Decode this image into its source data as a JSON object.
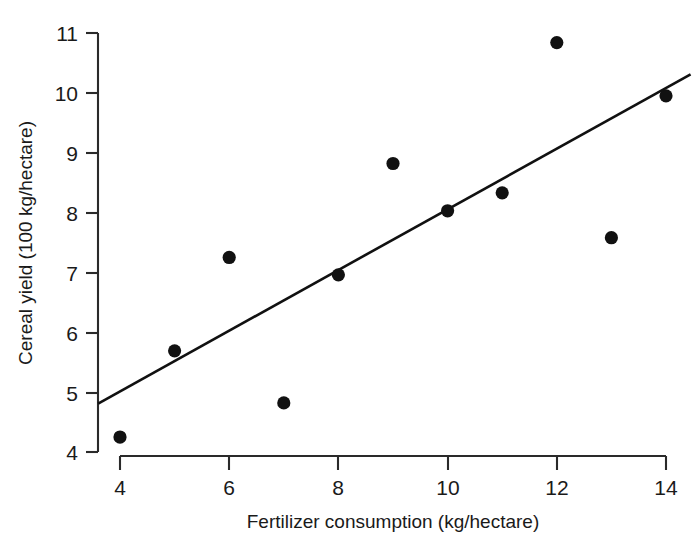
{
  "figure": {
    "background_color": "#ffffff",
    "foreground_color": "#1a1a1a",
    "width": 699,
    "height": 543
  },
  "chart_data": {
    "type": "scatter",
    "title": "",
    "subtitle": "",
    "xlabel": "Fertilizer consumption (kg/hectare)",
    "ylabel": "Cereal yield (100 kg/hectare)",
    "xlim": [
      3.6,
      14.6
    ],
    "ylim": [
      3.86,
      11.0
    ],
    "xticks": [
      4,
      6,
      8,
      10,
      12,
      14
    ],
    "xtick_labels": [
      "4",
      "6",
      "8",
      "10",
      "12",
      "14"
    ],
    "yticks": [
      4,
      5,
      6,
      7,
      8,
      9,
      10,
      11
    ],
    "ytick_labels": [
      "4",
      "5",
      "6",
      "7",
      "8",
      "9",
      "10",
      "11"
    ],
    "grid": false,
    "legend": false,
    "legend_position": "none",
    "marker": "filled-circle",
    "marker_color": "#111111",
    "marker_size": 7,
    "x": [
      4,
      5,
      6,
      7,
      8,
      9,
      10,
      11,
      12,
      13,
      14
    ],
    "y": [
      4.25,
      5.69,
      7.25,
      4.82,
      6.96,
      8.82,
      8.03,
      8.33,
      10.84,
      7.58,
      9.95
    ],
    "points": [
      {
        "x": 4,
        "y": 4.25
      },
      {
        "x": 5,
        "y": 5.69
      },
      {
        "x": 6,
        "y": 7.25
      },
      {
        "x": 7,
        "y": 4.82
      },
      {
        "x": 8,
        "y": 6.96
      },
      {
        "x": 9,
        "y": 8.82
      },
      {
        "x": 10,
        "y": 8.03
      },
      {
        "x": 11,
        "y": 8.33
      },
      {
        "x": 12,
        "y": 10.84
      },
      {
        "x": 13,
        "y": 7.58
      },
      {
        "x": 14,
        "y": 9.95
      }
    ],
    "trendline": {
      "name": "least-squares fit",
      "type": "line",
      "color": "#111111",
      "x_start": 3.6,
      "y_start": 4.81,
      "x_end": 14.45,
      "y_end": 10.31
    },
    "annotations": []
  }
}
